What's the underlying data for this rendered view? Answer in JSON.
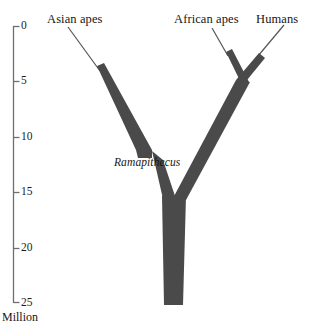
{
  "figure": {
    "kind": "phylogenetic-tree",
    "background_color": "#ffffff",
    "branch_color": "#4a4a4a",
    "line_color": "#545454",
    "axis_color": "#6a6a6a",
    "text_color": "#161616"
  },
  "axis": {
    "caption": "Million",
    "unit_label": "Million",
    "orientation": "vertical",
    "top_value": 0,
    "bottom_value": 25,
    "tick_labels": [
      "0",
      "5",
      "10",
      "15",
      "20",
      "25"
    ],
    "tick_values": [
      0,
      5,
      10,
      15,
      20,
      25
    ],
    "tick_pixel_y": [
      26,
      81,
      137,
      192,
      248,
      303
    ],
    "line_x": 13,
    "tick_length": 6
  },
  "taxa": [
    {
      "name": "asian-apes",
      "label": "Asian apes",
      "label_x": 47,
      "label_y": 14,
      "tip_x": 68,
      "tip_y": 27,
      "tip_age": 0
    },
    {
      "name": "african-apes",
      "label": "African apes",
      "label_x": 174,
      "label_y": 14,
      "tip_x": 212,
      "tip_y": 27,
      "tip_age": 0
    },
    {
      "name": "humans",
      "label": "Humans",
      "label_x": 256,
      "label_y": 14,
      "tip_x": 284,
      "tip_y": 25,
      "tip_age": 0
    }
  ],
  "fossil": {
    "name": "ramapithecus",
    "label": "Ramapithecus",
    "label_x": 114,
    "label_y": 157,
    "style": "italic"
  },
  "nodes": [
    {
      "name": "african-apes-humans-split",
      "x": 243,
      "y": 80,
      "age": 5
    },
    {
      "name": "root-split",
      "x": 172,
      "y": 207,
      "age": 16
    },
    {
      "name": "asian-lineage-terminus",
      "x": 145,
      "y": 157,
      "age": 12
    },
    {
      "name": "trunk-base",
      "x": 173,
      "y": 305,
      "age": 25
    }
  ],
  "geometry": {
    "trunk_left_x": 163,
    "trunk_right_x": 184,
    "trunk_top_y": 196,
    "trunk_bottom_y": 305,
    "asian_thin_start": "68,27",
    "african_thin_start": "212,28",
    "humans_thin_start": "284,25"
  }
}
